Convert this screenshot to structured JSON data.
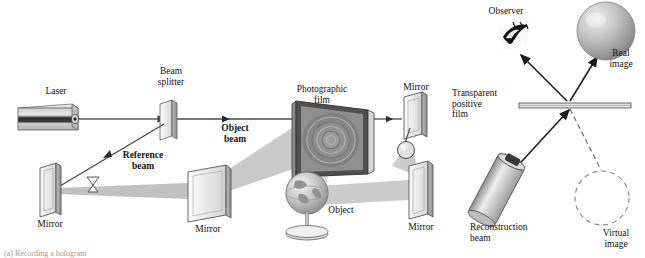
{
  "figure": {
    "background_color": "#ffffff",
    "ink_color": "#1a1a1a",
    "beam_fill_color": "#b0b0b0",
    "optic_face_color": "#e9e9e9",
    "clipped_caption": "(a) Recording a hologram"
  },
  "recording_panel": {
    "name": "recording-setup",
    "labels": {
      "laser": "Laser",
      "beam_splitter": "Beam\nsplitter",
      "object_beam": "Object\nbeam",
      "reference_beam": "Reference\nbeam",
      "photographic_film": "Photographic\nfilm",
      "mirror_left": "Mirror",
      "mirror_center": "Mirror",
      "mirror_top_right": "Mirror",
      "mirror_bottom_right": "Mirror",
      "object": "Object"
    },
    "components": [
      {
        "id": "laser",
        "type": "laser-box",
        "label": "Laser"
      },
      {
        "id": "beam-splitter",
        "type": "tilted-plate",
        "label": "Beam splitter"
      },
      {
        "id": "mirror-left",
        "type": "mirror-plate",
        "label": "Mirror"
      },
      {
        "id": "mirror-center",
        "type": "mirror-plate",
        "label": "Mirror"
      },
      {
        "id": "mirror-top-right",
        "type": "mirror-plate",
        "label": "Mirror"
      },
      {
        "id": "mirror-bottom-right",
        "type": "mirror-plate",
        "label": "Mirror"
      },
      {
        "id": "beam-expander-reference",
        "type": "bowtie-lens",
        "label": ""
      },
      {
        "id": "beam-expander-object",
        "type": "circular-lens",
        "label": ""
      },
      {
        "id": "photographic-film",
        "type": "film-frame",
        "label": "Photographic film"
      },
      {
        "id": "object-globe",
        "type": "globe-on-stand",
        "label": "Object"
      }
    ]
  },
  "reconstruction_panel": {
    "name": "reconstruction-setup",
    "labels": {
      "observer": "Observer",
      "real_image": "Real\nimage",
      "transparent_positive_film": "Transparent\npositive\nfilm",
      "reconstruction_beam": "Reconstruction\nbeam",
      "virtual_image": "Virtual\nimage"
    },
    "components": [
      {
        "id": "observer-eye",
        "type": "eye-icon",
        "label": "Observer"
      },
      {
        "id": "real-image-sphere",
        "type": "shaded-sphere",
        "label": "Real image"
      },
      {
        "id": "virtual-image-circle",
        "type": "dashed-circle",
        "label": "Virtual image"
      },
      {
        "id": "transparent-film-bar",
        "type": "horizontal-bar",
        "label": "Transparent positive film"
      },
      {
        "id": "reconstruction-laser",
        "type": "cylinder-laser",
        "label": "Reconstruction beam"
      }
    ]
  }
}
